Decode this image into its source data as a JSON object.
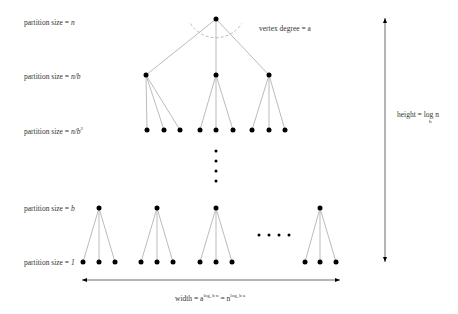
{
  "labels": {
    "level0": {
      "prefix": "partition size = ",
      "value": "n"
    },
    "level1": {
      "prefix": "partition size = ",
      "value": "n/b"
    },
    "level2": {
      "prefix": "partition size = ",
      "value": "n/b",
      "sup": "2"
    },
    "level3": {
      "prefix": "partition size = ",
      "value": "b"
    },
    "level4": {
      "prefix": "partition size = ",
      "value": "1"
    },
    "vertex_degree": "vertex degree = a",
    "height": {
      "prefix": "height = log n",
      "sub": "b"
    },
    "width": {
      "prefix": "width = a",
      "sup1": "log_b n",
      "mid": " = n",
      "sup2": "log_b a"
    }
  },
  "colors": {
    "node": "#000000",
    "edge": "#aaaaaa",
    "arc": "#bbbbbb",
    "arrow": "#444444"
  },
  "tree": {
    "root": [
      216,
      19
    ],
    "level1": [
      [
        146,
        75
      ],
      [
        216,
        75
      ],
      [
        269,
        75
      ]
    ],
    "level2_y": 130,
    "level2_x": [
      147,
      164,
      180,
      200,
      216,
      233,
      252,
      269,
      285
    ],
    "vdots": [
      [
        216,
        151
      ],
      [
        216,
        161
      ],
      [
        216,
        171
      ],
      [
        216,
        181
      ]
    ],
    "level3_y": 208,
    "level3_x": [
      99,
      157,
      216,
      320
    ],
    "leaves_y": 262,
    "leaves_x": [
      [
        83,
        99,
        115
      ],
      [
        141,
        157,
        173
      ],
      [
        200,
        216,
        232
      ],
      [
        305,
        320,
        336
      ]
    ],
    "hdots": [
      [
        259,
        235
      ],
      [
        269,
        235
      ],
      [
        279,
        235
      ],
      [
        289,
        235
      ]
    ]
  },
  "arrows": {
    "horizontal": {
      "x1": 82,
      "x2": 340,
      "y": 280
    },
    "vertical": {
      "x": 385,
      "y1": 18,
      "y2": 262
    }
  }
}
